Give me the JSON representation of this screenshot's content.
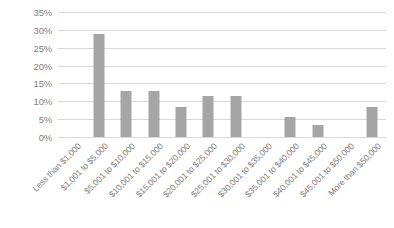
{
  "chart_data": {
    "type": "bar",
    "title": "",
    "subtitle": "",
    "xlabel": "",
    "ylabel": "",
    "ylim": [
      0,
      35
    ],
    "ytick_step": 5,
    "grid": true,
    "legend": "none",
    "bar_color": "#a5a5a5",
    "gridline_color": "#d9d9d9",
    "axis_text_color": "#808080",
    "background": "#ffffff",
    "ytick_labels": [
      "35%",
      "30%",
      "25%",
      "20%",
      "15%",
      "10%",
      "5%",
      "0%"
    ],
    "ytick_values": [
      35,
      30,
      25,
      20,
      15,
      10,
      5,
      0
    ],
    "categories": [
      "Less than $1,000",
      "$1,001 to $5,000",
      "$5,001 to $10,000",
      "$10,001 to $15,000",
      "$15,001 to $20,000",
      "$20,001 to $25,000",
      "$25,001 to $30,000",
      "$30,001 to $35,000",
      "$35,001 to $40,000",
      "$40,001 to $45,000",
      "$45,001 to $50,000",
      "More than $50,000"
    ],
    "values": [
      0,
      28.8,
      13,
      13,
      8.5,
      11.5,
      11.5,
      0,
      5.5,
      3.5,
      0,
      8.5
    ]
  }
}
